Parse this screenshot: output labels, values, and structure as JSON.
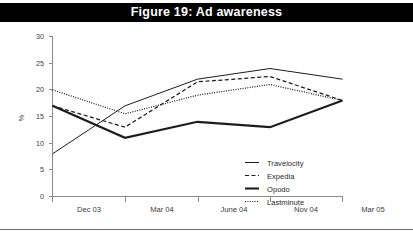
{
  "figure": {
    "title": "Figure 19: Ad awareness"
  },
  "chart_data": {
    "type": "line",
    "title": "Figure 19: Ad awareness",
    "xlabel": "",
    "ylabel": "%",
    "categories": [
      "Dec 03",
      "Mar 04",
      "June 04",
      "Nov 04",
      "Mar 05"
    ],
    "ylim": [
      0,
      30
    ],
    "yticks": [
      0,
      5,
      10,
      15,
      20,
      25,
      30
    ],
    "ytick_labels": [
      "0",
      "5",
      "10",
      "15",
      "20",
      "25",
      "30"
    ],
    "grid": false,
    "legend_position": "inside-lower-right",
    "series": [
      {
        "name": "Travelocity",
        "style": "solid-thin",
        "values": [
          8,
          17,
          22,
          24,
          22
        ]
      },
      {
        "name": "Expedia",
        "style": "dashed",
        "values": [
          17,
          13,
          21.5,
          22.5,
          18
        ]
      },
      {
        "name": "Opodo",
        "style": "solid-thick",
        "values": [
          17,
          11,
          14,
          13,
          18
        ]
      },
      {
        "name": "Lastminute",
        "style": "dotted",
        "values": [
          20,
          15.5,
          19,
          21,
          18
        ]
      }
    ]
  },
  "legend": {
    "entries": [
      {
        "label": "Travelocity",
        "swatch": "solid-thin-line-icon"
      },
      {
        "label": "Expedia",
        "swatch": "dashed-line-icon"
      },
      {
        "label": "Opodo",
        "swatch": "solid-thick-line-icon"
      },
      {
        "label": "Lastminute",
        "swatch": "dotted-line-icon"
      }
    ]
  }
}
